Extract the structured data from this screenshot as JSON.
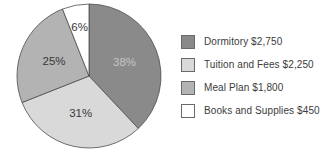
{
  "figure": {
    "background_color": "#ffffff",
    "outline_color": "#4c4c4c"
  },
  "chart_data": {
    "type": "pie",
    "title": "",
    "categories": [
      "Dormitory",
      "Tuition and Fees",
      "Meal Plan",
      "Books and Supplies"
    ],
    "values": [
      2750,
      2250,
      1800,
      450
    ],
    "percentages": [
      38,
      31,
      25,
      6
    ],
    "start_angle": "12-o-clock",
    "direction": "clockwise",
    "legend_position": "right",
    "slices": [
      {
        "label": "Dormitory",
        "amount": 2750,
        "pct": 38,
        "pct_label": "38%",
        "legend_label": "Dormitory $2,750",
        "color": "#8a8a8a",
        "pct_text_color": "#c5c5c5"
      },
      {
        "label": "Tuition and Fees",
        "amount": 2250,
        "pct": 31,
        "pct_label": "31%",
        "legend_label": "Tuition and Fees $2,250",
        "color": "#d9d9d9",
        "pct_text_color": "#383838"
      },
      {
        "label": "Meal Plan",
        "amount": 1800,
        "pct": 25,
        "pct_label": "25%",
        "legend_label": "Meal Plan $1,800",
        "color": "#b3b3b3",
        "pct_text_color": "#383838"
      },
      {
        "label": "Books and Supplies",
        "amount": 450,
        "pct": 6,
        "pct_label": "6%",
        "legend_label": "Books and Supplies $450",
        "color": "#ffffff",
        "pct_text_color": "#383838"
      }
    ]
  }
}
